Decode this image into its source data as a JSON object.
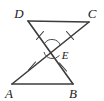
{
  "figure": {
    "background_color": "#ffffff",
    "line_color": "#3c3c3c",
    "label_color": "#1a1a1a"
  },
  "vertices": [
    {
      "name": "D",
      "label": "D",
      "x": 28,
      "y": 21,
      "label_x": 24,
      "label_y": 15
    },
    {
      "name": "C",
      "label": "C",
      "x": 89,
      "y": 22,
      "label_x": 89,
      "label_y": 15
    },
    {
      "name": "E",
      "label": "E",
      "x": 52,
      "y": 49,
      "label_x": 62,
      "label_y": 57
    },
    {
      "name": "A",
      "label": "A",
      "x": 12,
      "y": 84,
      "label_x": 8,
      "label_y": 96
    },
    {
      "name": "B",
      "label": "B",
      "x": 73,
      "y": 84,
      "label_x": 70,
      "label_y": 96
    }
  ],
  "segments": [
    {
      "name": "segment-DC",
      "from": "D",
      "to": "C"
    },
    {
      "name": "segment-AB",
      "from": "A",
      "to": "B"
    },
    {
      "name": "segment-D-to-B",
      "from": "D",
      "to": "B"
    },
    {
      "name": "segment-C-to-A",
      "from": "C",
      "to": "A"
    }
  ],
  "tick_marks": [
    {
      "name": "tick-DE",
      "x": 40,
      "y": 35,
      "angle": 42,
      "count": 1
    },
    {
      "name": "tick-CE",
      "x": 70,
      "y": 35,
      "angle": -42,
      "count": 1
    },
    {
      "name": "tick-AE",
      "x": 32,
      "y": 66,
      "angle": -42,
      "count": 1
    },
    {
      "name": "tick-BE",
      "x": 63,
      "y": 67,
      "angle": 42,
      "count": 1
    }
  ],
  "angle_marks": [
    {
      "name": "angle-arc-DEC",
      "cx": 52,
      "cy": 49,
      "r": 9,
      "position": "above-E"
    },
    {
      "name": "angle-arc-AEB",
      "cx": 52,
      "cy": 49,
      "r": 9,
      "position": "below-E"
    }
  ]
}
